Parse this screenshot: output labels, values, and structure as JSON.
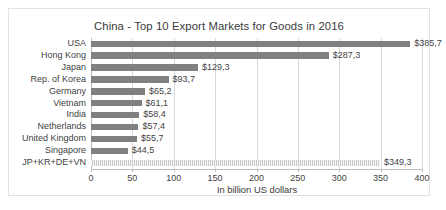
{
  "chart_data": {
    "type": "bar",
    "orientation": "horizontal",
    "title": "China - Top 10 Export Markets for Goods in 2016",
    "xlabel": "In billion US dollars",
    "ylabel": "",
    "xlim": [
      0,
      400
    ],
    "xticks": [
      "0",
      "50",
      "100",
      "150",
      "200",
      "250",
      "300",
      "350",
      "400"
    ],
    "xtick_values": [
      0,
      50,
      100,
      150,
      200,
      250,
      300,
      350,
      400
    ],
    "grid": "vertical",
    "legend": "none",
    "categories": [
      "USA",
      "Hong Kong",
      "Japan",
      "Rep. of Korea",
      "Germany",
      "Vietnam",
      "India",
      "Netherlands",
      "United Kingdom",
      "Singapore",
      "JP+KR+DE+VN"
    ],
    "values": [
      385.7,
      287.3,
      129.3,
      93.7,
      65.2,
      61.1,
      58.4,
      57.4,
      55.7,
      44.5,
      349.3
    ],
    "data_labels": [
      "$385,7",
      "$287,3",
      "$129,3",
      "$93,7",
      "$65,2",
      "$61,1",
      "$58,4",
      "$57,4",
      "$55,7",
      "$44,5",
      "$349,3"
    ],
    "bar_styles": [
      "solid",
      "solid",
      "solid",
      "solid",
      "solid",
      "solid",
      "solid",
      "solid",
      "solid",
      "solid",
      "hatched"
    ],
    "colors": {
      "bar_solid": "#808080",
      "bar_hatched": "#c9c9c9",
      "gridline": "#d9d9d9",
      "axis": "#bdbdbd",
      "text": "#3f3f3f",
      "title_text": "#3a3a3a",
      "plot_background": "#ffffff",
      "frame_border": "#e2e2e2"
    }
  }
}
